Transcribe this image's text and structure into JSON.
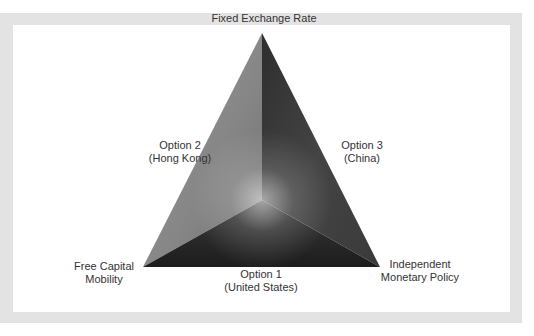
{
  "diagram": {
    "vertices": {
      "top": {
        "label": "Fixed Exchange Rate"
      },
      "bottom_left": {
        "line1": "Free Capital",
        "line2": "Mobility"
      },
      "bottom_right": {
        "line1": "Independent",
        "line2": "Monetary Policy"
      }
    },
    "options": {
      "left_side": {
        "line1": "Option 2",
        "line2": "(Hong Kong)"
      },
      "right_side": {
        "line1": "Option 3",
        "line2": "(China)"
      },
      "bottom_side": {
        "line1": "Option 1",
        "line2": "(United States)"
      }
    },
    "colors": {
      "frame": "#e3e3e3",
      "panel": "#ffffff",
      "text": "#333333",
      "left_face": "#8a8a8a",
      "right_face": "#444444",
      "bottom_face": "#2a2a2a"
    }
  }
}
